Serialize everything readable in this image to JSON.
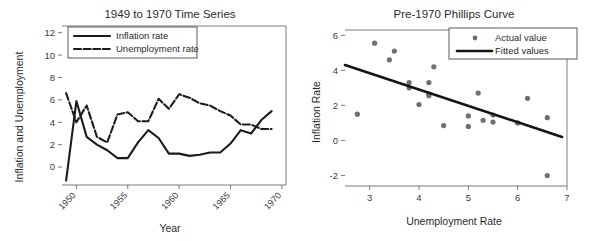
{
  "chart_data": [
    {
      "type": "line",
      "title": "1949 to 1970 Time Series",
      "xlabel": "Year",
      "ylabel": "Inflation and Unemployment",
      "xlim": [
        1948.6,
        1970.4
      ],
      "ylim": [
        -1.6,
        12.6
      ],
      "xticks": [
        1950,
        1955,
        1960,
        1965,
        1970
      ],
      "yticks": [
        0,
        2,
        4,
        6,
        8,
        10,
        12
      ],
      "grid": false,
      "legend_position": "top-left",
      "x": [
        1949,
        1950,
        1951,
        1952,
        1953,
        1954,
        1955,
        1956,
        1957,
        1958,
        1959,
        1960,
        1961,
        1962,
        1963,
        1964,
        1965,
        1966,
        1967,
        1968,
        1969
      ],
      "series": [
        {
          "name": "Inflation rate",
          "style": "solid",
          "values": [
            -1.2,
            5.9,
            2.7,
            2.0,
            1.5,
            0.8,
            0.8,
            2.2,
            3.3,
            2.6,
            1.2,
            1.2,
            1.0,
            1.1,
            1.3,
            1.3,
            2.1,
            3.3,
            3.0,
            4.2,
            5.0
          ]
        },
        {
          "name": "Unemployment rate",
          "style": "dashed",
          "values": [
            6.6,
            4.0,
            5.5,
            2.7,
            2.2,
            4.7,
            4.9,
            4.1,
            4.1,
            6.1,
            5.2,
            6.5,
            6.2,
            5.7,
            5.5,
            5.0,
            4.6,
            3.8,
            3.8,
            3.4,
            3.4
          ]
        }
      ]
    },
    {
      "type": "scatter",
      "title": "Pre-1970 Phillips Curve",
      "xlabel": "Unemployment Rate",
      "ylabel": "Inflation Rate",
      "xlim": [
        2.5,
        7.0
      ],
      "ylim": [
        -2.6,
        6.3
      ],
      "xticks": [
        3,
        4,
        5,
        6,
        7
      ],
      "yticks": [
        -2,
        0,
        2,
        4,
        6
      ],
      "grid": false,
      "legend_position": "top-right",
      "points": [
        {
          "x": 2.75,
          "y": 1.5
        },
        {
          "x": 3.1,
          "y": 5.55
        },
        {
          "x": 3.4,
          "y": 4.6
        },
        {
          "x": 3.5,
          "y": 5.1
        },
        {
          "x": 3.8,
          "y": 3.3
        },
        {
          "x": 3.8,
          "y": 3.0
        },
        {
          "x": 4.0,
          "y": 2.05
        },
        {
          "x": 4.2,
          "y": 3.3
        },
        {
          "x": 4.2,
          "y": 2.65
        },
        {
          "x": 4.2,
          "y": 2.55
        },
        {
          "x": 4.3,
          "y": 4.2
        },
        {
          "x": 4.5,
          "y": 0.85
        },
        {
          "x": 5.0,
          "y": 1.4
        },
        {
          "x": 5.0,
          "y": 0.8
        },
        {
          "x": 5.2,
          "y": 2.7
        },
        {
          "x": 5.3,
          "y": 1.15
        },
        {
          "x": 5.5,
          "y": 1.45
        },
        {
          "x": 5.5,
          "y": 1.05
        },
        {
          "x": 6.0,
          "y": 1.0
        },
        {
          "x": 6.2,
          "y": 2.4
        },
        {
          "x": 6.6,
          "y": 1.3
        },
        {
          "x": 6.6,
          "y": -2.0
        }
      ],
      "fit_line": {
        "x0": 2.5,
        "y0": 4.3,
        "x1": 6.9,
        "y1": 0.2
      },
      "legend": [
        {
          "label": "Actual value",
          "marker": "dot"
        },
        {
          "label": "Fitted values",
          "marker": "line"
        }
      ]
    }
  ],
  "colors": {
    "series": "#1c1c1c",
    "point": "#6f6f6f",
    "frame": "#7a7a7a",
    "text": "#2b2b2b",
    "background": "#ffffff"
  }
}
